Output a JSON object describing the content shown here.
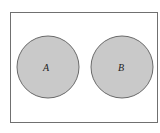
{
  "diagram": {
    "type": "venn",
    "universe": {
      "x": 10,
      "y": 12,
      "width": 147,
      "height": 110
    },
    "sets": [
      {
        "label": "A",
        "cx": 48,
        "cy": 67,
        "r": 31
      },
      {
        "label": "B",
        "cx": 122,
        "cy": 67,
        "r": 31
      }
    ],
    "colors": {
      "fill": "#c9c9c9",
      "stroke": "#6a6a6a",
      "border": "#707070",
      "background": "#ffffff"
    }
  }
}
